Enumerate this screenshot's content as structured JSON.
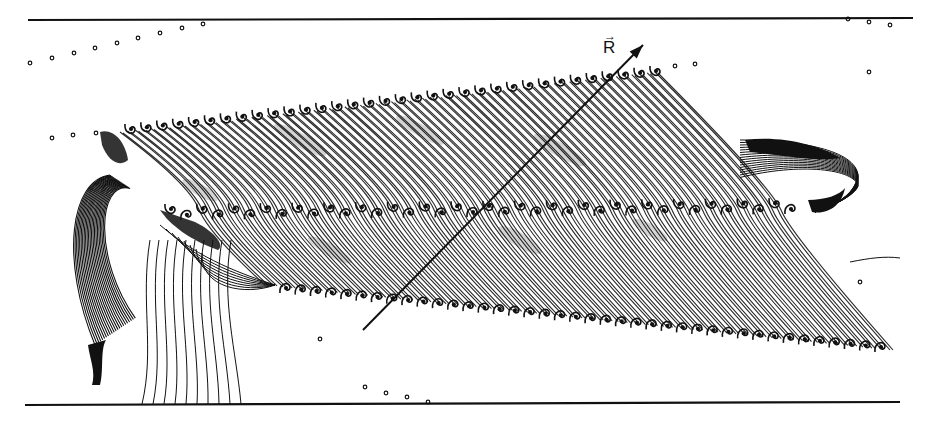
{
  "figure": {
    "width": 933,
    "height": 422,
    "ink_color": "#111111",
    "background": "#ffffff",
    "vector_label": "R",
    "vector_arrow_glyph": "→",
    "boundaries": {
      "top": {
        "x1": 28,
        "y1": 20,
        "x2": 913,
        "y2": 18
      },
      "bottom": {
        "x1": 25,
        "y1": 405,
        "x2": 900,
        "y2": 402
      }
    },
    "vector_R": {
      "x1": 363,
      "y1": 330,
      "x2": 643,
      "y2": 45,
      "label_x": 603,
      "label_y": 38
    },
    "band": {
      "upper_edge": {
        "x_start": 100,
        "y_start": 132,
        "x_end": 655,
        "y_end": 72
      },
      "middle_line": {
        "x_start": 170,
        "y_start": 212,
        "x_end": 790,
        "y_end": 206
      },
      "lower_edge": {
        "x_start": 265,
        "y_start": 285,
        "x_end": 890,
        "y_end": 350
      },
      "streamline_count": 70,
      "roll_count_upper": 34,
      "roll_count_middle": 40,
      "roll_count_lower": 40
    },
    "tracer_dots": [
      [
        30,
        63
      ],
      [
        52,
        58
      ],
      [
        74,
        53
      ],
      [
        95,
        48
      ],
      [
        117,
        43
      ],
      [
        138,
        38
      ],
      [
        160,
        33
      ],
      [
        182,
        28
      ],
      [
        203,
        24
      ],
      [
        52,
        138
      ],
      [
        73,
        135
      ],
      [
        96,
        133
      ],
      [
        848,
        19
      ],
      [
        869,
        22
      ],
      [
        890,
        25
      ],
      [
        695,
        64
      ],
      [
        869,
        72
      ],
      [
        675,
        66
      ],
      [
        860,
        282
      ],
      [
        320,
        339
      ],
      [
        365,
        387
      ],
      [
        386,
        393
      ],
      [
        407,
        397
      ],
      [
        428,
        402
      ]
    ]
  }
}
